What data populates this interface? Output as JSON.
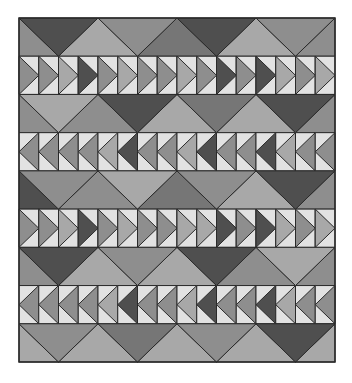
{
  "image": {
    "subject": "Flying geese quilt pattern",
    "width": 352,
    "height": 383
  },
  "quilt": {
    "x": 19,
    "y": 18,
    "width": 316,
    "height": 344,
    "outline_color": "#2a2a2a",
    "palette": {
      "L": "#e2e2e2",
      "A": "#a8a8a8",
      "M": "#8e8e8e",
      "N": "#767676",
      "D": "#4f4f4f"
    },
    "rows": [
      {
        "type": "big",
        "down": [
          "D",
          "M",
          "D",
          "M"
        ],
        "up": [
          "M",
          "A",
          "N",
          "A",
          "M"
        ]
      },
      {
        "type": "geese",
        "dir": "right",
        "geese": [
          "M",
          "M",
          "A",
          "D",
          "M",
          "A",
          "M",
          "M",
          "A",
          "M",
          "D",
          "M",
          "D",
          "A",
          "M",
          "A"
        ]
      },
      {
        "type": "big",
        "down": [
          "A",
          "D",
          "N",
          "D"
        ],
        "up": [
          "M",
          "M",
          "A",
          "A",
          "M"
        ]
      },
      {
        "type": "geese",
        "dir": "left",
        "geese": [
          "M",
          "M",
          "M",
          "M",
          "A",
          "D",
          "M",
          "M",
          "A",
          "D",
          "M",
          "M",
          "D",
          "A",
          "M",
          "M"
        ]
      },
      {
        "type": "big",
        "down": [
          "M",
          "A",
          "M",
          "D"
        ],
        "up": [
          "D",
          "M",
          "N",
          "A",
          "M"
        ]
      },
      {
        "type": "geese",
        "dir": "right",
        "geese": [
          "M",
          "M",
          "A",
          "D",
          "M",
          "A",
          "M",
          "M",
          "A",
          "A",
          "D",
          "M",
          "D",
          "A",
          "M",
          "A"
        ]
      },
      {
        "type": "big",
        "down": [
          "D",
          "M",
          "D",
          "A"
        ],
        "up": [
          "M",
          "A",
          "A",
          "M",
          "M"
        ]
      },
      {
        "type": "geese",
        "dir": "left",
        "geese": [
          "M",
          "M",
          "M",
          "M",
          "A",
          "D",
          "M",
          "M",
          "A",
          "D",
          "M",
          "M",
          "D",
          "A",
          "M",
          "M"
        ]
      },
      {
        "type": "big",
        "down": [
          "M",
          "N",
          "M",
          "D"
        ],
        "up": [
          "A",
          "A",
          "A",
          "A",
          "A"
        ]
      }
    ]
  }
}
